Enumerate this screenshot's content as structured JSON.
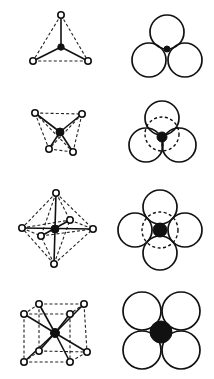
{
  "diagram": {
    "rows": [
      {
        "name": "tetrahedral",
        "coordination_number": 4,
        "left": {
          "type": "ball-and-stick",
          "center": [
            61,
            47
          ],
          "ligands": [
            [
              61,
              15
            ],
            [
              33,
              61
            ],
            [
              88,
              61
            ]
          ]
        },
        "right": {
          "type": "sphere-packing",
          "spheres": [
            [
              167,
              32,
              17
            ],
            [
              149,
              60,
              17
            ],
            [
              185,
              60,
              17
            ]
          ],
          "hidden_spheres": [],
          "center_atom": [
            167,
            49,
            3
          ]
        }
      },
      {
        "name": "trigonal-bipyramidal-distorted",
        "coordination_number": 4,
        "left": {
          "type": "ball-and-stick",
          "center": [
            60,
            132
          ],
          "ligands": [
            [
              35,
              113
            ],
            [
              82,
              114
            ],
            [
              49,
              149
            ],
            [
              73,
              152
            ]
          ]
        },
        "right": {
          "type": "sphere-packing",
          "spheres": [
            [
              162,
              118,
              17
            ],
            [
              146,
              145,
              17
            ],
            [
              179,
              145,
              17
            ]
          ],
          "hidden_spheres": [
            [
              162,
              134,
              17
            ]
          ],
          "center_atom": [
            162,
            137,
            5
          ]
        }
      },
      {
        "name": "octahedral",
        "coordination_number": 6,
        "left": {
          "type": "ball-and-stick",
          "center": [
            55,
            229
          ],
          "ligands": [
            [
              56,
              193
            ],
            [
              54,
              264
            ],
            [
              22,
              228
            ],
            [
              93,
              229
            ],
            [
              70,
              220
            ],
            [
              41,
              236
            ]
          ]
        },
        "right": {
          "type": "sphere-packing",
          "spheres": [
            [
              160,
              207,
              17
            ],
            [
              160,
              253,
              17
            ],
            [
              135,
              230,
              17
            ],
            [
              185,
              230,
              17
            ]
          ],
          "hidden_spheres": [
            [
              160,
              230,
              18
            ]
          ],
          "center_atom": [
            160,
            230,
            7
          ]
        }
      },
      {
        "name": "cubic",
        "coordination_number": 8,
        "left": {
          "type": "ball-and-stick",
          "center": [
            55,
            333
          ],
          "ligands": [
            [
              39,
              304
            ],
            [
              84,
              304
            ],
            [
              24,
              314
            ],
            [
              70,
              314
            ],
            [
              39,
              351
            ],
            [
              87,
              352
            ],
            [
              24,
              362
            ],
            [
              70,
              362
            ]
          ]
        },
        "right": {
          "type": "sphere-packing",
          "spheres": [
            [
              142,
              311,
              19
            ],
            [
              181,
              311,
              19
            ],
            [
              142,
              350,
              19
            ],
            [
              181,
              350,
              19
            ]
          ],
          "hidden_spheres": [],
          "center_atom": [
            161,
            332,
            11
          ]
        }
      }
    ],
    "colors": {
      "line": "#111111",
      "background": "#ffffff",
      "ligand_fill": "#ffffff",
      "metal_fill": "#111111"
    }
  }
}
